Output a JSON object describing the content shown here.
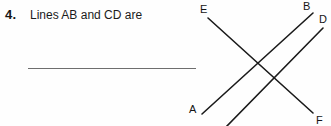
{
  "question": {
    "number": "4.",
    "text": "Lines AB and CD are",
    "answer_blank_value": ""
  },
  "figure": {
    "name": "two-intersecting-lines-diagram",
    "stroke_color": "#1a1a1a",
    "labels": [
      {
        "id": "E",
        "text": "E"
      },
      {
        "id": "B",
        "text": "B"
      },
      {
        "id": "D",
        "text": "D"
      },
      {
        "id": "A",
        "text": "A"
      },
      {
        "id": "F",
        "text": "F"
      }
    ],
    "segments": [
      {
        "name": "line-EF",
        "x1": 208,
        "y1": 18,
        "x2": 313,
        "y2": 113
      },
      {
        "name": "line-AB",
        "x1": 202,
        "y1": 114,
        "x2": 313,
        "y2": 13
      },
      {
        "name": "line-CD",
        "x1": 226,
        "y1": 127,
        "x2": 323,
        "y2": 28
      }
    ]
  }
}
